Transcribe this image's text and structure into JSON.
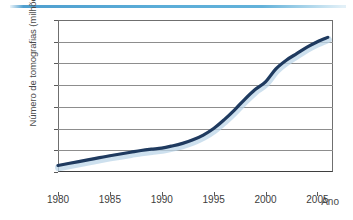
{
  "decoration": {
    "top_rule_color": "#5badd8"
  },
  "chart_data": {
    "type": "line",
    "title": "",
    "subtitle": "",
    "xlabel": "Ano",
    "ylabel": "Número de tomografias (milhões)",
    "xlim": [
      1980,
      2006.5
    ],
    "ylim": [
      0,
      70
    ],
    "grid": true,
    "legend": "none",
    "line_color": "#1f3a5f",
    "glow_color": "#bcd6e8",
    "xticks": [
      1980,
      1985,
      1990,
      1995,
      2000,
      2005
    ],
    "xtick_labels": [
      "1980",
      "1985",
      "1990",
      "1995",
      "2000",
      "2005"
    ],
    "yticks": [
      0,
      10,
      20,
      30,
      40,
      50,
      60,
      70
    ],
    "ytick_labels": [
      "0",
      "10",
      "20",
      "30",
      "40",
      "50",
      "60",
      "70"
    ],
    "series": [
      {
        "name": "Número de tomografias",
        "x": [
          1980,
          1981,
          1982,
          1983,
          1984,
          1985,
          1986,
          1987,
          1988,
          1989,
          1990,
          1991,
          1992,
          1993,
          1994,
          1995,
          1996,
          1997,
          1998,
          1999,
          2000,
          2001,
          2002,
          2003,
          2004,
          2005,
          2006
        ],
        "values": [
          3,
          3.9,
          4.8,
          5.7,
          6.6,
          7.5,
          8.3,
          9.1,
          9.9,
          10.5,
          11,
          12,
          13.2,
          14.8,
          17,
          20,
          24,
          28.5,
          33.5,
          38,
          41.5,
          47.5,
          51.5,
          54.5,
          57.5,
          60,
          62
        ]
      }
    ]
  }
}
